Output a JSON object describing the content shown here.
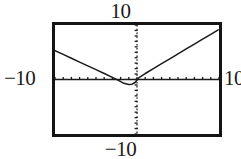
{
  "screen": {
    "width": 241,
    "height": 159,
    "background_color": "#ffffff",
    "frame_color": "#141414",
    "curve_color": "#1a1a1a",
    "axis_color": "#1a1a1a"
  },
  "labels": {
    "y_max": "10",
    "y_min": "−10",
    "x_min": "−10",
    "x_max": "10"
  },
  "chart_data": {
    "type": "line",
    "title": "",
    "xlabel": "",
    "ylabel": "",
    "xlim": [
      -10,
      10
    ],
    "ylim": [
      -10,
      10
    ],
    "grid": false,
    "legend": "none",
    "axes": {
      "x_axis_ticks": 20,
      "y_axis_ticks": 20,
      "x_tick_step": 1,
      "y_tick_step": 1,
      "x_axis_style": "solid-with-ticks",
      "y_axis_style": "dotted-with-ticks"
    },
    "annotations": [
      "Window range labels: 10 top, -10 bottom, -10 left, 10 right",
      "V-shaped absolute-value style graph with vertex slightly below and left of the origin"
    ],
    "series": [
      {
        "name": "v-curve",
        "points": [
          [
            -10.0,
            5.3
          ],
          [
            -9.0,
            4.6
          ],
          [
            -8.0,
            3.9
          ],
          [
            -7.0,
            3.2
          ],
          [
            -6.0,
            2.5
          ],
          [
            -5.0,
            1.8
          ],
          [
            -4.0,
            1.1
          ],
          [
            -3.0,
            0.4
          ],
          [
            -2.2,
            -0.2
          ],
          [
            -1.6,
            -0.7
          ],
          [
            -1.0,
            -0.9
          ],
          [
            -0.6,
            -0.85
          ],
          [
            -0.2,
            -0.5
          ],
          [
            0.2,
            0.3
          ],
          [
            1.0,
            1.1
          ],
          [
            2.0,
            2.0
          ],
          [
            3.0,
            2.9
          ],
          [
            4.0,
            3.8
          ],
          [
            5.0,
            4.7
          ],
          [
            6.0,
            5.6
          ],
          [
            7.0,
            6.5
          ],
          [
            8.0,
            7.4
          ],
          [
            9.0,
            8.3
          ],
          [
            9.9,
            9.1
          ]
        ]
      }
    ]
  }
}
